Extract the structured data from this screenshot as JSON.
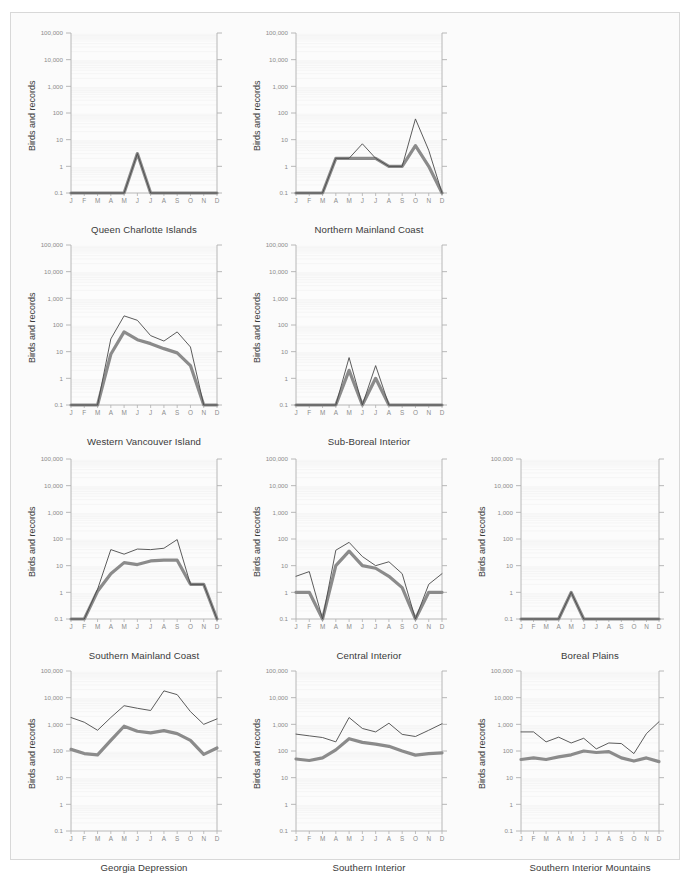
{
  "figure": {
    "axis_label": "Birds and records",
    "months": [
      "J",
      "F",
      "M",
      "A",
      "M",
      "J",
      "J",
      "A",
      "S",
      "O",
      "N",
      "D"
    ],
    "ytick_labels": [
      "100,000",
      "10,000",
      "1,000",
      "100",
      "10",
      "1",
      "0.1"
    ],
    "ytick_values": [
      100000,
      10000,
      1000,
      100,
      10,
      1,
      0.1
    ],
    "colors": {
      "thin_line": "#4a4a4a",
      "thick_line": "#8b8b8b",
      "axis": "#b0b0b0",
      "grid": "#f0f0f0",
      "plot_background": "#fcfcfc",
      "card_background": "#fbfbfb",
      "tick_text": "#8c8c8c",
      "caption_text": "#3a3a3a"
    },
    "footer_note": ""
  },
  "chart_data": [
    {
      "type": "line",
      "title": "Queen Charlotte Islands",
      "xlabel": "",
      "ylabel": "Birds and records",
      "categories": [
        "J",
        "F",
        "M",
        "A",
        "M",
        "J",
        "J",
        "A",
        "S",
        "O",
        "N",
        "D"
      ],
      "ylim": [
        0.1,
        100000
      ],
      "yscale": "log",
      "grid": true,
      "legend": "none",
      "series": [
        {
          "name": "records",
          "style": "thin",
          "values": [
            0.1,
            0.1,
            0.1,
            0.1,
            0.1,
            3,
            0.1,
            0.1,
            0.1,
            0.1,
            0.1,
            0.1
          ]
        },
        {
          "name": "birds",
          "style": "thick",
          "values": [
            0.1,
            0.1,
            0.1,
            0.1,
            0.1,
            3,
            0.1,
            0.1,
            0.1,
            0.1,
            0.1,
            0.1
          ]
        }
      ]
    },
    {
      "type": "line",
      "title": "Northern Mainland Coast",
      "xlabel": "",
      "ylabel": "Birds and records",
      "categories": [
        "J",
        "F",
        "M",
        "A",
        "M",
        "J",
        "J",
        "A",
        "S",
        "O",
        "N",
        "D"
      ],
      "ylim": [
        0.1,
        100000
      ],
      "yscale": "log",
      "grid": true,
      "legend": "none",
      "series": [
        {
          "name": "records",
          "style": "thin",
          "values": [
            0.1,
            0.1,
            0.1,
            2,
            2,
            7,
            2,
            1,
            1,
            60,
            4,
            0.1
          ]
        },
        {
          "name": "birds",
          "style": "thick",
          "values": [
            0.1,
            0.1,
            0.1,
            2,
            2,
            2,
            2,
            1,
            1,
            6,
            1,
            0.1
          ]
        }
      ]
    },
    {
      "type": "line",
      "title": "Western Vancouver Island",
      "xlabel": "",
      "ylabel": "Birds and records",
      "categories": [
        "J",
        "F",
        "M",
        "A",
        "M",
        "J",
        "J",
        "A",
        "S",
        "O",
        "N",
        "D"
      ],
      "ylim": [
        0.1,
        100000
      ],
      "yscale": "log",
      "grid": true,
      "legend": "none",
      "series": [
        {
          "name": "records",
          "style": "thin",
          "values": [
            0.1,
            0.1,
            0.1,
            30,
            220,
            150,
            40,
            25,
            55,
            15,
            0.1,
            0.1
          ]
        },
        {
          "name": "birds",
          "style": "thick",
          "values": [
            0.1,
            0.1,
            0.1,
            8,
            55,
            28,
            20,
            13,
            9,
            3,
            0.1,
            0.1
          ]
        }
      ]
    },
    {
      "type": "line",
      "title": "Sub-Boreal Interior",
      "xlabel": "",
      "ylabel": "Birds and records",
      "categories": [
        "J",
        "F",
        "M",
        "A",
        "M",
        "J",
        "J",
        "A",
        "S",
        "O",
        "N",
        "D"
      ],
      "ylim": [
        0.1,
        100000
      ],
      "yscale": "log",
      "grid": true,
      "legend": "none",
      "series": [
        {
          "name": "records",
          "style": "thin",
          "values": [
            0.1,
            0.1,
            0.1,
            0.1,
            6,
            0.1,
            3,
            0.1,
            0.1,
            0.1,
            0.1,
            0.1
          ]
        },
        {
          "name": "birds",
          "style": "thick",
          "values": [
            0.1,
            0.1,
            0.1,
            0.1,
            2,
            0.1,
            1,
            0.1,
            0.1,
            0.1,
            0.1,
            0.1
          ]
        }
      ]
    },
    {
      "type": "line",
      "title": "Southern Mainland Coast",
      "xlabel": "",
      "ylabel": "Birds and records",
      "categories": [
        "J",
        "F",
        "M",
        "A",
        "M",
        "J",
        "J",
        "A",
        "S",
        "O",
        "N",
        "D"
      ],
      "ylim": [
        0.1,
        100000
      ],
      "yscale": "log",
      "grid": true,
      "legend": "none",
      "series": [
        {
          "name": "records",
          "style": "thin",
          "values": [
            0.1,
            0.1,
            1.3,
            40,
            27,
            42,
            40,
            45,
            95,
            2,
            2,
            0.1
          ]
        },
        {
          "name": "birds",
          "style": "thick",
          "values": [
            0.1,
            0.1,
            1.1,
            5,
            13,
            11,
            15,
            16,
            16,
            2,
            2,
            0.1
          ]
        }
      ]
    },
    {
      "type": "line",
      "title": "Central Interior",
      "xlabel": "",
      "ylabel": "Birds and records",
      "categories": [
        "J",
        "F",
        "M",
        "A",
        "M",
        "J",
        "J",
        "A",
        "S",
        "O",
        "N",
        "D"
      ],
      "ylim": [
        0.1,
        100000
      ],
      "yscale": "log",
      "grid": true,
      "legend": "none",
      "series": [
        {
          "name": "records",
          "style": "thin",
          "values": [
            4,
            6,
            0.1,
            38,
            75,
            22,
            10,
            14,
            5,
            0.1,
            2,
            5
          ]
        },
        {
          "name": "birds",
          "style": "thick",
          "values": [
            1,
            1,
            0.1,
            10,
            35,
            10,
            8,
            4,
            1.5,
            0.1,
            1,
            1
          ]
        }
      ]
    },
    {
      "type": "line",
      "title": "Boreal Plains",
      "xlabel": "",
      "ylabel": "Birds and records",
      "categories": [
        "J",
        "F",
        "M",
        "A",
        "M",
        "J",
        "J",
        "A",
        "S",
        "O",
        "N",
        "D"
      ],
      "ylim": [
        0.1,
        100000
      ],
      "yscale": "log",
      "grid": true,
      "legend": "none",
      "series": [
        {
          "name": "records",
          "style": "thin",
          "values": [
            0.1,
            0.1,
            0.1,
            0.1,
            1,
            0.1,
            0.1,
            0.1,
            0.1,
            0.1,
            0.1,
            0.1
          ]
        },
        {
          "name": "birds",
          "style": "thick",
          "values": [
            0.1,
            0.1,
            0.1,
            0.1,
            1,
            0.1,
            0.1,
            0.1,
            0.1,
            0.1,
            0.1,
            0.1
          ]
        }
      ]
    },
    {
      "type": "line",
      "title": "Georgia Depression",
      "xlabel": "",
      "ylabel": "Birds and records",
      "categories": [
        "J",
        "F",
        "M",
        "A",
        "M",
        "J",
        "J",
        "A",
        "S",
        "O",
        "N",
        "D"
      ],
      "ylim": [
        0.1,
        100000
      ],
      "yscale": "log",
      "grid": true,
      "legend": "none",
      "series": [
        {
          "name": "records",
          "style": "thin",
          "values": [
            1800,
            1200,
            600,
            1800,
            5000,
            4000,
            3300,
            18000,
            13000,
            3000,
            1000,
            1600
          ]
        },
        {
          "name": "birds",
          "style": "thick",
          "values": [
            115,
            80,
            72,
            250,
            850,
            550,
            480,
            580,
            450,
            250,
            75,
            130
          ]
        }
      ]
    },
    {
      "type": "line",
      "title": "Southern Interior",
      "xlabel": "",
      "ylabel": "Birds and records",
      "categories": [
        "J",
        "F",
        "M",
        "A",
        "M",
        "J",
        "J",
        "A",
        "S",
        "O",
        "N",
        "D"
      ],
      "ylim": [
        0.1,
        100000
      ],
      "yscale": "log",
      "grid": true,
      "legend": "none",
      "series": [
        {
          "name": "records",
          "style": "thin",
          "values": [
            430,
            370,
            320,
            220,
            1800,
            700,
            520,
            1100,
            420,
            350,
            600,
            1050
          ]
        },
        {
          "name": "birds",
          "style": "thick",
          "values": [
            50,
            44,
            55,
            110,
            290,
            210,
            180,
            150,
            100,
            70,
            80,
            85
          ]
        }
      ]
    },
    {
      "type": "line",
      "title": "Southern Interior Mountains",
      "xlabel": "",
      "ylabel": "Birds and records",
      "categories": [
        "J",
        "F",
        "M",
        "A",
        "M",
        "J",
        "J",
        "A",
        "S",
        "O",
        "N",
        "D"
      ],
      "ylim": [
        0.1,
        100000
      ],
      "yscale": "log",
      "grid": true,
      "legend": "none",
      "series": [
        {
          "name": "records",
          "style": "thin",
          "values": [
            520,
            520,
            220,
            330,
            200,
            300,
            120,
            200,
            190,
            80,
            450,
            1250
          ]
        },
        {
          "name": "birds",
          "style": "thick",
          "values": [
            48,
            55,
            48,
            60,
            72,
            100,
            88,
            95,
            55,
            42,
            55,
            40
          ]
        }
      ]
    }
  ],
  "layout": {
    "panels": [
      {
        "chart": 0,
        "row": 0,
        "col": 0
      },
      {
        "chart": 1,
        "row": 0,
        "col": 1
      },
      {
        "chart": 2,
        "row": 1,
        "col": 0
      },
      {
        "chart": 3,
        "row": 1,
        "col": 1
      },
      {
        "chart": 4,
        "row": 2,
        "col": 0
      },
      {
        "chart": 5,
        "row": 2,
        "col": 1
      },
      {
        "chart": 6,
        "row": 2,
        "col": 2
      },
      {
        "chart": 7,
        "row": 3,
        "col": 0
      },
      {
        "chart": 8,
        "row": 3,
        "col": 1
      },
      {
        "chart": 9,
        "row": 3,
        "col": 2
      }
    ]
  }
}
